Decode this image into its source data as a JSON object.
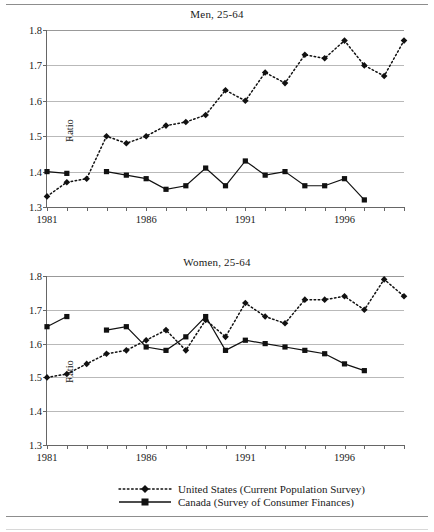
{
  "figure": {
    "y_axis_title": "Ratio",
    "y_ticks": [
      "1.3",
      "1.4",
      "1.5",
      "1.6",
      "1.7",
      "1.8"
    ],
    "x_ticks_labeled": [
      "1981",
      "1986",
      "1991",
      "1996"
    ]
  },
  "legend": {
    "items": [
      {
        "label": "United States (Current Population Survey)",
        "style": "dotted-diamond"
      },
      {
        "label": "Canada (Survey of Consumer Finances)",
        "style": "solid-square"
      }
    ]
  },
  "chart_data": [
    {
      "type": "line",
      "title": "Men, 25-64",
      "xlabel": "",
      "ylabel": "Ratio",
      "ylim": [
        1.3,
        1.8
      ],
      "xlim": [
        1981,
        1999
      ],
      "grid": true,
      "legend_position": "below-figure",
      "x": [
        1981,
        1982,
        1983,
        1984,
        1985,
        1986,
        1987,
        1988,
        1989,
        1990,
        1991,
        1992,
        1993,
        1994,
        1995,
        1996,
        1997,
        1998,
        1999
      ],
      "series": [
        {
          "name": "United States (Current Population Survey)",
          "marker": "diamond",
          "line": "dotted",
          "values": [
            1.33,
            1.37,
            1.38,
            1.5,
            1.48,
            1.5,
            1.53,
            1.54,
            1.56,
            1.63,
            1.6,
            1.68,
            1.65,
            1.73,
            1.72,
            1.77,
            1.7,
            1.67,
            1.77
          ]
        },
        {
          "name": "Canada (Survey of Consumer Finances)",
          "marker": "square",
          "line": "solid",
          "values": [
            1.4,
            1.395,
            null,
            1.4,
            1.39,
            1.38,
            1.35,
            1.36,
            1.41,
            1.36,
            1.43,
            1.39,
            1.4,
            1.36,
            1.36,
            1.38,
            1.32,
            null,
            null
          ]
        }
      ]
    },
    {
      "type": "line",
      "title": "Women, 25-64",
      "xlabel": "",
      "ylabel": "Ratio",
      "ylim": [
        1.3,
        1.8
      ],
      "xlim": [
        1981,
        1999
      ],
      "grid": true,
      "legend_position": "below-figure",
      "x": [
        1981,
        1982,
        1983,
        1984,
        1985,
        1986,
        1987,
        1988,
        1989,
        1990,
        1991,
        1992,
        1993,
        1994,
        1995,
        1996,
        1997,
        1998,
        1999
      ],
      "series": [
        {
          "name": "United States (Current Population Survey)",
          "marker": "diamond",
          "line": "dotted",
          "values": [
            1.5,
            1.51,
            1.54,
            1.57,
            1.58,
            1.61,
            1.64,
            1.58,
            1.67,
            1.62,
            1.72,
            1.68,
            1.66,
            1.73,
            1.73,
            1.74,
            1.7,
            1.79,
            1.74
          ]
        },
        {
          "name": "Canada (Survey of Consumer Finances)",
          "marker": "square",
          "line": "solid",
          "values": [
            1.65,
            1.68,
            null,
            1.64,
            1.65,
            1.59,
            1.58,
            1.62,
            1.68,
            1.58,
            1.61,
            1.6,
            1.59,
            1.58,
            1.57,
            1.54,
            1.52,
            null,
            null
          ]
        }
      ]
    }
  ]
}
